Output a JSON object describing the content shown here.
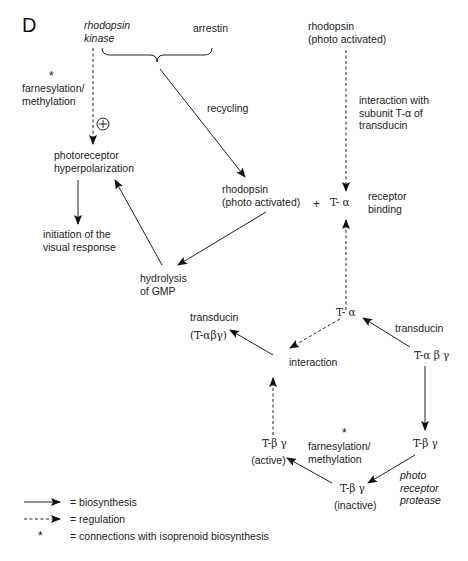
{
  "panel_label": "D",
  "nodes": {
    "rhodopsin_kinase": [
      "rhodopsin",
      "kinase"
    ],
    "arrestin": "arrestin",
    "farnesylation_top": [
      "farnesylation/",
      "methylation"
    ],
    "star": "*",
    "plus_circle": "+",
    "recycling": "recycling",
    "photoreceptor_hyperpolarization": [
      "photoreceptor",
      "hyperpolarization"
    ],
    "initiation": [
      "initiation of the",
      "visual response"
    ],
    "hydrolysis": [
      "hydrolysis",
      "of GMP"
    ],
    "rhodopsin_mid": [
      "rhodopsin",
      "(photo activated)"
    ],
    "plus": "+",
    "t_alpha_top": "T- α",
    "receptor_binding": [
      "receptor",
      "binding"
    ],
    "rhodopsin_top": [
      "rhodopsin",
      "(photo activated)"
    ],
    "interaction_with": [
      "interaction with",
      "subunit T-α  of",
      "transducin"
    ],
    "t_alpha_bottom": "T- α",
    "transducin_right": "transducin",
    "t_alpha_beta_gamma": "T-α β γ",
    "interaction": "interaction",
    "transducin_left": [
      "transducin",
      "(T-αβγ)"
    ],
    "t_beta_gamma_right": "T-β γ",
    "farnesylation_bottom": [
      "farnesylation/",
      "methylation"
    ],
    "t_beta_gamma_active": [
      "T-β γ",
      "(active)"
    ],
    "t_beta_gamma_inactive": [
      "T-β γ",
      "(inactive)"
    ],
    "photo_receptor_protease": [
      "photo",
      "receptor",
      "protease"
    ]
  },
  "legend": [
    {
      "symbol": "solid-arrow",
      "label": "= biosynthesis"
    },
    {
      "symbol": "dashed-arrow",
      "label": "= regulation"
    },
    {
      "symbol": "*",
      "label": "= connections with isoprenoid biosynthesis"
    }
  ]
}
